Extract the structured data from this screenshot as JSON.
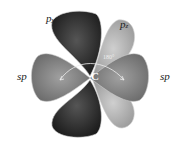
{
  "diagram": {
    "labels": {
      "py": {
        "main": "p",
        "sub": "y"
      },
      "pz": {
        "main": "p",
        "sub": "z"
      },
      "sp_left": "sp",
      "sp_right": "sp",
      "center": "C",
      "angle": "180°"
    },
    "colors": {
      "py_lobe": "#2a2a2a",
      "pz_lobe": "#a8a8a8",
      "sp_lobe": "#7a7a7a",
      "background": "#ffffff"
    }
  }
}
